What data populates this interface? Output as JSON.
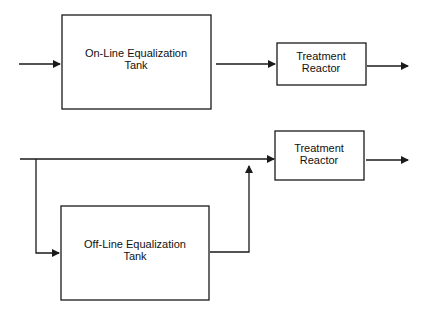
{
  "diagram": {
    "colors": {
      "stroke": "#1a1a1a",
      "text": "#111111",
      "background": "#ffffff"
    },
    "top_flow": {
      "equalization_tank": {
        "line1": "On-Line Equalization",
        "line2": "Tank"
      },
      "reactor": {
        "line1": "Treatment",
        "line2": "Reactor"
      }
    },
    "bottom_flow": {
      "equalization_tank": {
        "line1": "Off-Line Equalization",
        "line2": "Tank"
      },
      "reactor": {
        "line1": "Treatment",
        "line2": "Reactor"
      }
    }
  }
}
